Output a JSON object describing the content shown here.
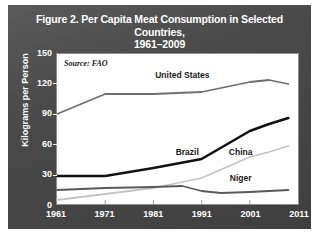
{
  "figure": {
    "title_line1": "Figure 2. Per Capita Meat Consumption in Selected Countries,",
    "title_line2": "1961–2009",
    "card_background": "#4a4a4a",
    "title_color": "#ffffff",
    "plot_background": "#ffffff"
  },
  "source_note": "Source: FAO",
  "chart_data": {
    "type": "line",
    "title": "Figure 2. Per Capita Meat Consumption in Selected Countries, 1961–2009",
    "subtitle": "1961–2009",
    "xlabel": "",
    "ylabel": "Kilograms per Person",
    "xlim": [
      1961,
      2011
    ],
    "ylim": [
      0,
      150
    ],
    "xticks": [
      1961,
      1971,
      1981,
      1991,
      2001,
      2011
    ],
    "yticks": [
      0,
      30,
      60,
      90,
      120,
      150
    ],
    "grid": false,
    "legend_position": "inline-labels",
    "annotation": "Source: FAO",
    "series": [
      {
        "name": "United States",
        "color": "#6e6e6e",
        "width": 1.8,
        "label_x": 1987,
        "label_y": 128,
        "x": [
          1961,
          1971,
          1981,
          1991,
          2001,
          2005,
          2009
        ],
        "values": [
          90,
          110,
          110,
          112,
          122,
          124,
          120
        ]
      },
      {
        "name": "Brazil",
        "color": "#111111",
        "width": 2.6,
        "label_x": 1988,
        "label_y": 52,
        "x": [
          1961,
          1971,
          1981,
          1991,
          2001,
          2005,
          2009
        ],
        "values": [
          28,
          28,
          36,
          45,
          73,
          80,
          86
        ]
      },
      {
        "name": "China",
        "color": "#c4c4c4",
        "width": 1.8,
        "label_x": 1999,
        "label_y": 52,
        "x": [
          1961,
          1971,
          1981,
          1991,
          2001,
          2005,
          2009
        ],
        "values": [
          4,
          10,
          16,
          26,
          47,
          52,
          58
        ]
      },
      {
        "name": "Niger",
        "color": "#595959",
        "width": 1.8,
        "label_x": 1999,
        "label_y": 27,
        "x": [
          1961,
          1971,
          1981,
          1987,
          1991,
          1995,
          2001,
          2009
        ],
        "values": [
          14,
          16,
          17,
          18,
          13,
          11,
          12,
          14
        ]
      }
    ]
  }
}
